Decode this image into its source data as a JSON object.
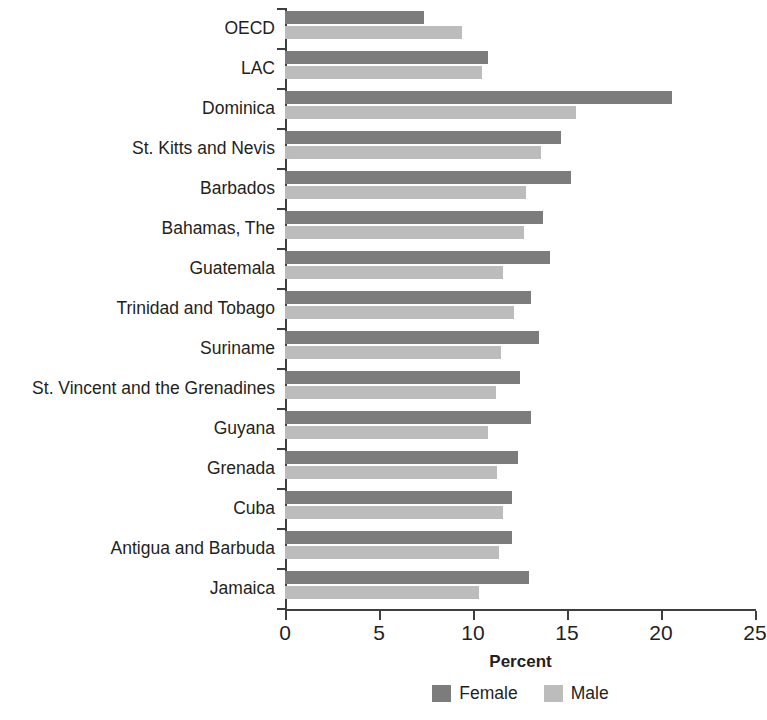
{
  "chart_data": {
    "type": "bar",
    "orientation": "horizontal",
    "title": "",
    "xlabel": "Percent",
    "ylabel": "",
    "xlim": [
      0,
      25
    ],
    "xticks": [
      0,
      5,
      10,
      15,
      20,
      25
    ],
    "grid": false,
    "legend_position": "bottom",
    "categories": [
      "OECD",
      "LAC",
      "Dominica",
      "St. Kitts and Nevis",
      "Barbados",
      "Bahamas, The",
      "Guatemala",
      "Trinidad and Tobago",
      "Suriname",
      "St. Vincent and the Grenadines",
      "Guyana",
      "Grenada",
      "Cuba",
      "Antigua and Barbuda",
      "Jamaica"
    ],
    "series": [
      {
        "name": "Female",
        "color": "#7c7c7c",
        "values": [
          7.4,
          10.8,
          20.6,
          14.7,
          15.2,
          13.7,
          14.1,
          13.1,
          13.5,
          12.5,
          13.1,
          12.4,
          12.1,
          12.1,
          13.0
        ]
      },
      {
        "name": "Male",
        "color": "#bcbcbc",
        "values": [
          9.4,
          10.5,
          15.5,
          13.6,
          12.8,
          12.7,
          11.6,
          12.2,
          11.5,
          11.2,
          10.8,
          11.3,
          11.6,
          11.4,
          10.3
        ]
      }
    ]
  },
  "axis": {
    "x_tick_labels": [
      "0",
      "5",
      "10",
      "15",
      "20",
      "25"
    ],
    "x_title": "Percent"
  },
  "legend": {
    "items": [
      {
        "label": "Female",
        "color": "#7c7c7c"
      },
      {
        "label": "Male",
        "color": "#bcbcbc"
      }
    ]
  }
}
